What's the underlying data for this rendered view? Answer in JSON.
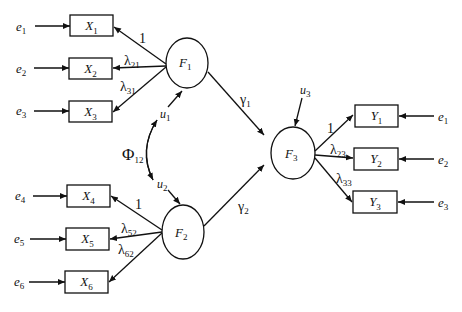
{
  "diagram": {
    "type": "structural-equation-model",
    "exogenous_factor_1": {
      "label": "F",
      "sub": "1",
      "indicators": [
        {
          "label": "X",
          "sub": "1",
          "error": "e",
          "error_sub": "1",
          "loading": "1",
          "loading_sub": ""
        },
        {
          "label": "X",
          "sub": "2",
          "error": "e",
          "error_sub": "2",
          "loading": "λ",
          "loading_sub": "21"
        },
        {
          "label": "X",
          "sub": "3",
          "error": "e",
          "error_sub": "3",
          "loading": "λ",
          "loading_sub": "31"
        }
      ],
      "disturbance": {
        "label": "u",
        "sub": "1"
      },
      "path_to_F3": {
        "label": "γ",
        "sub": "1"
      }
    },
    "exogenous_factor_2": {
      "label": "F",
      "sub": "2",
      "indicators": [
        {
          "label": "X",
          "sub": "4",
          "error": "e",
          "error_sub": "4",
          "loading": "1",
          "loading_sub": ""
        },
        {
          "label": "X",
          "sub": "5",
          "error": "e",
          "error_sub": "5",
          "loading": "λ",
          "loading_sub": "52"
        },
        {
          "label": "X",
          "sub": "6",
          "error": "e",
          "error_sub": "6",
          "loading": "λ",
          "loading_sub": "62"
        }
      ],
      "disturbance": {
        "label": "u",
        "sub": "2"
      },
      "path_to_F3": {
        "label": "γ",
        "sub": "2"
      }
    },
    "covariance": {
      "label": "Φ",
      "sub": "12"
    },
    "endogenous_factor": {
      "label": "F",
      "sub": "3",
      "disturbance": {
        "label": "u",
        "sub": "3"
      },
      "indicators": [
        {
          "label": "Y",
          "sub": "1",
          "error": "e",
          "error_sub": "1",
          "loading": "1",
          "loading_sub": ""
        },
        {
          "label": "Y",
          "sub": "2",
          "error": "e",
          "error_sub": "2",
          "loading": "λ",
          "loading_sub": "23"
        },
        {
          "label": "Y",
          "sub": "3",
          "error": "e",
          "error_sub": "3",
          "loading": "λ",
          "loading_sub": "33"
        }
      ]
    }
  }
}
